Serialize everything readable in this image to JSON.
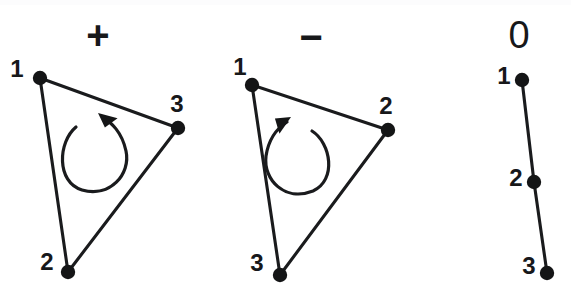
{
  "figure": {
    "background_color": "#ffffff",
    "ink_color": "#141516",
    "width": 571,
    "height": 294
  },
  "panels": [
    {
      "id": "positive",
      "sign_label": "+",
      "sign_pos": {
        "x": 98,
        "y": 38
      },
      "orientation": "counter-clockwise",
      "shape": "triangle",
      "vertices": [
        {
          "label": "1",
          "x": 40,
          "y": 78,
          "label_x": 17,
          "label_y": 71
        },
        {
          "label": "2",
          "x": 68,
          "y": 272,
          "label_x": 47,
          "label_y": 264
        },
        {
          "label": "3",
          "x": 178,
          "y": 128,
          "label_x": 177,
          "label_y": 106
        }
      ],
      "edges": [
        [
          0,
          2
        ],
        [
          0,
          1
        ],
        [
          1,
          2
        ]
      ],
      "loop": {
        "path": "M 76 127 C 58 142 56 182 82 190 C 110 198 131 174 126 151 C 122 132 111 122 103 118",
        "arrow_tip": {
          "x": 98,
          "y": 113
        },
        "arrow_angle": -145
      }
    },
    {
      "id": "negative",
      "sign_label": "−",
      "sign_pos": {
        "x": 311,
        "y": 40
      },
      "orientation": "clockwise",
      "shape": "triangle",
      "vertices": [
        {
          "label": "1",
          "x": 252,
          "y": 85,
          "label_x": 240,
          "label_y": 69
        },
        {
          "label": "2",
          "x": 388,
          "y": 130,
          "label_x": 386,
          "label_y": 108
        },
        {
          "label": "3",
          "x": 280,
          "y": 275,
          "label_x": 257,
          "label_y": 265
        }
      ],
      "edges": [
        [
          0,
          1
        ],
        [
          0,
          2
        ],
        [
          1,
          2
        ]
      ],
      "loop": {
        "path": "M 312 131 C 331 143 337 180 313 191 C 285 202 263 180 266 156 C 269 137 279 127 287 122",
        "arrow_tip": {
          "x": 291,
          "y": 117
        },
        "arrow_angle": -35
      }
    },
    {
      "id": "zero",
      "sign_label": "0",
      "sign_pos": {
        "x": 519,
        "y": 38
      },
      "orientation": "collinear",
      "shape": "segment",
      "vertices": [
        {
          "label": "1",
          "x": 522,
          "y": 80,
          "label_x": 504,
          "label_y": 78
        },
        {
          "label": "2",
          "x": 534,
          "y": 182,
          "label_x": 516,
          "label_y": 180
        },
        {
          "label": "3",
          "x": 547,
          "y": 273,
          "label_x": 529,
          "label_y": 268
        }
      ],
      "edges": [
        [
          0,
          1
        ],
        [
          1,
          2
        ]
      ],
      "loop": null
    }
  ]
}
